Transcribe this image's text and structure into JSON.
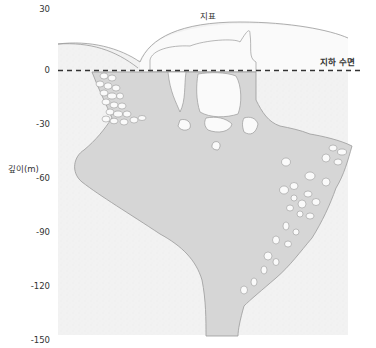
{
  "diagram": {
    "labels": {
      "surface": "지표",
      "water_table": "지하 수면",
      "y_axis": "깊이(m)"
    },
    "y_ticks": [
      "30",
      "0",
      "-30",
      "-60",
      "-90",
      "-120",
      "-150"
    ],
    "colors": {
      "bedrock": "#f3f3f3",
      "water_filled_cave": "#d6d6d6",
      "air_filled_cave": "#fafafa",
      "outline": "#9a9a9a",
      "water_table_line": "#333333",
      "text": "#333333"
    }
  }
}
